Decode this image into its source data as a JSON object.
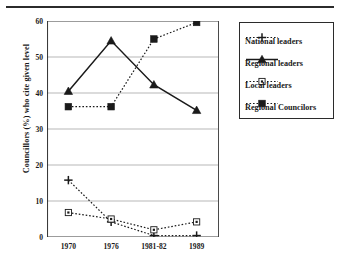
{
  "figure": {
    "top_rule": true
  },
  "axes": {
    "ylabel": "Councillors (%) who cite given level",
    "yticks": [
      "0",
      "10",
      "20",
      "30",
      "40",
      "50",
      "60"
    ],
    "xticks": [
      "1970",
      "1976",
      "1981-82",
      "1989"
    ]
  },
  "legend": {
    "entries": [
      {
        "label": "National leaders",
        "marker": "plus-marker",
        "line": "dotted"
      },
      {
        "label": "Regional leaders",
        "marker": "triangle-marker",
        "line": "solid"
      },
      {
        "label": "Local leaders",
        "marker": "open-square-marker",
        "line": "dotted"
      },
      {
        "label": "Regional Councilors",
        "marker": "filled-square-marker",
        "line": "dotted"
      }
    ]
  },
  "chart_data": {
    "type": "line",
    "title": "",
    "xlabel": "",
    "ylabel": "Councillors (%) who cite given level",
    "categories": [
      "1970",
      "1976",
      "1981-82",
      "1989"
    ],
    "ylim": [
      0,
      60
    ],
    "yticks": [
      0,
      10,
      20,
      30,
      40,
      50,
      60
    ],
    "grid": "horizontal",
    "legend_position": "right-outside",
    "series": [
      {
        "name": "National leaders",
        "marker": "plus",
        "linestyle": "dotted",
        "color": "#1a1a1a",
        "values": [
          15.8,
          4.2,
          0.4,
          0.4
        ]
      },
      {
        "name": "Regional leaders",
        "marker": "triangle",
        "linestyle": "solid",
        "color": "#1a1a1a",
        "values": [
          40.5,
          54.5,
          42.3,
          35.2
        ]
      },
      {
        "name": "Local leaders",
        "marker": "open-square",
        "linestyle": "dotted",
        "color": "#1a1a1a",
        "values": [
          6.8,
          5.0,
          2.0,
          4.2
        ]
      },
      {
        "name": "Regional Councilors",
        "marker": "filled-square",
        "linestyle": "dotted",
        "color": "#1a1a1a",
        "values": [
          36.2,
          36.2,
          55.0,
          59.6
        ]
      }
    ]
  }
}
